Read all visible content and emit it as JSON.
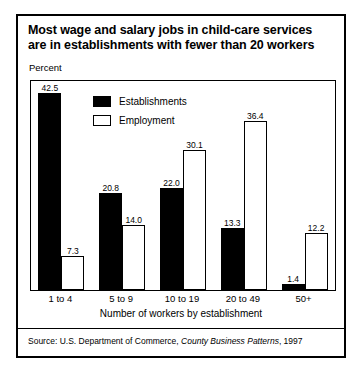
{
  "figure": {
    "title_line1": "Most wage and salary jobs in child-care services",
    "title_line2": "are in establishments with fewer than 20 workers",
    "percent_label": "Percent",
    "axis_title": "Number of workers by establishment",
    "source_prefix": "Source: U.S. Department of Commerce,",
    "source_italic": "County Business Patterns",
    "source_suffix": ", 1997"
  },
  "colors": {
    "establishments": "#000000",
    "employment": "#ffffff",
    "outline": "#000000",
    "background": "#ffffff"
  },
  "chart_data": {
    "type": "bar",
    "title": "Most wage and salary jobs in child-care services are in establishments with fewer than 20 workers",
    "xlabel": "Number of workers by establishment",
    "ylabel": "Percent",
    "ylim": [
      0,
      45
    ],
    "grid": false,
    "legend_position": "top-left-inside",
    "categories": [
      "1 to 4",
      "5 to 9",
      "10 to 19",
      "20 to 49",
      "50+"
    ],
    "series": [
      {
        "name": "Establishments",
        "values": [
          42.5,
          20.8,
          22.0,
          13.3,
          1.4
        ],
        "labels": [
          "42.5",
          "20.8",
          "22.0",
          "13.3",
          "1.4"
        ]
      },
      {
        "name": "Employment",
        "values": [
          7.3,
          14.0,
          30.1,
          36.4,
          12.2
        ],
        "labels": [
          "7.3",
          "14.0",
          "30.1",
          "36.4",
          "12.2"
        ]
      }
    ],
    "source": "Source: U.S. Department of Commerce, County Business Patterns, 1997"
  }
}
